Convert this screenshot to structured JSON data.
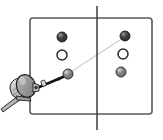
{
  "figure": {
    "name": "stereo-targets-diagram",
    "background_color": "#ffffff",
    "width": 163,
    "height": 140
  },
  "frame": {
    "name": "outer-frame",
    "label": "Target board outline",
    "x": 30,
    "y": 18,
    "width": 122,
    "height": 96,
    "corner_radius": 3,
    "stroke_color": "#595959",
    "stroke_width": 1.6,
    "fill_color": "#ffffff"
  },
  "divider": {
    "name": "vertical-center-line",
    "label": "Panel divider / optical axis",
    "x": 97,
    "y_top": 6,
    "y_bottom": 130,
    "stroke_color": "#3d3d3d",
    "stroke_width": 1.5
  },
  "panels": [
    {
      "name": "left-panel",
      "label": "Left target panel"
    },
    {
      "name": "right-panel",
      "label": "Right target panel"
    }
  ],
  "markers": [
    {
      "id": "L1",
      "panel": "left",
      "style": "filled-dark",
      "cx": 62,
      "cy": 37,
      "r": 5.0,
      "fill": "#3a3a3a",
      "stroke": "#1c1c1c",
      "highlight": "#8e8e8e"
    },
    {
      "id": "L2",
      "panel": "left",
      "style": "hollow",
      "cx": 62,
      "cy": 55,
      "r": 5.0,
      "fill": "#ffffff",
      "stroke": "#2b2b2b",
      "highlight": "#ffffff"
    },
    {
      "id": "L3",
      "panel": "left",
      "style": "filled-gray",
      "cx": 68,
      "cy": 74,
      "r": 5.0,
      "fill": "#7d7d7d",
      "stroke": "#262626",
      "highlight": "#c9c9c9"
    },
    {
      "id": "R1",
      "panel": "right",
      "style": "filled-dark",
      "cx": 125,
      "cy": 36,
      "r": 5.0,
      "fill": "#3a3a3a",
      "stroke": "#1c1c1c",
      "highlight": "#8e8e8e"
    },
    {
      "id": "R2",
      "panel": "right",
      "style": "hollow",
      "cx": 123,
      "cy": 54,
      "r": 5.0,
      "fill": "#ffffff",
      "stroke": "#2b2b2b",
      "highlight": "#ffffff"
    },
    {
      "id": "R3",
      "panel": "right",
      "style": "filled-gray",
      "cx": 121,
      "cy": 72,
      "r": 5.0,
      "fill": "#7d7d7d",
      "stroke": "#262626",
      "highlight": "#c9c9c9"
    }
  ],
  "sight_line": {
    "name": "sight-line",
    "label": "Line of sight from lower-left marker to upper-right marker",
    "x1": 60,
    "y1": 79,
    "x2": 126,
    "y2": 36,
    "stroke_color": "#cfcfcf",
    "stroke_width": 1.4
  },
  "pointer": {
    "name": "pointer-arm",
    "label": "Probe arm aimed at marker L3",
    "x1": 37,
    "y1": 88,
    "x2": 63,
    "y2": 77,
    "stroke_color": "#141414",
    "stroke_width": 2.6
  },
  "device": {
    "name": "handheld-probe-device",
    "label": "Hand-held probe / pointing device",
    "body_fill": "#9a9a9a",
    "body_stroke": "#1f1f1f",
    "body_cx": 26,
    "body_cy": 86,
    "body_rx": 9.5,
    "body_ry": 11.5,
    "body_rotation": -18,
    "grip_fill": "#d2d2d2",
    "grip_stroke": "#1f1f1f",
    "cable_stroke": "#1f1f1f",
    "cable_fill": "#b4b4b4"
  },
  "legend": {
    "filled_dark_label": "Filled dark marker",
    "hollow_label": "Hollow marker",
    "filled_gray_label": "Filled gray marker"
  }
}
